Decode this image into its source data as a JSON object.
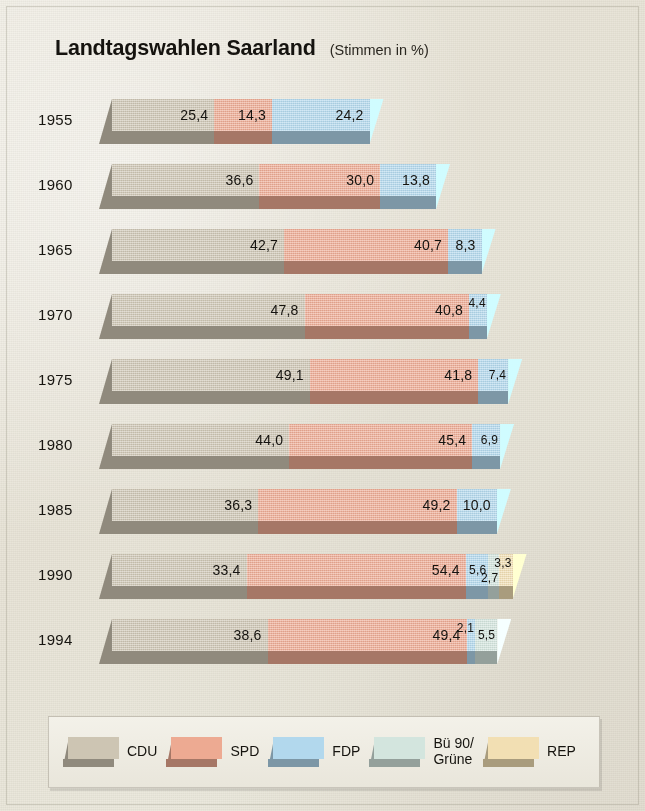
{
  "header": {
    "title": "Landtagswahlen Saarland",
    "subtitle": "(Stimmen in %)"
  },
  "chart_data": {
    "type": "bar",
    "orientation": "horizontal",
    "stacked": true,
    "title": "Landtagswahlen Saarland",
    "subtitle": "(Stimmen in %)",
    "xlabel": "",
    "ylabel": "",
    "unit": "%",
    "decimal_separator": ",",
    "grid": false,
    "legend_position": "bottom",
    "categories": [
      "1955",
      "1960",
      "1965",
      "1970",
      "1975",
      "1980",
      "1985",
      "1990",
      "1994"
    ],
    "series": [
      {
        "name": "CDU",
        "color": "#cdc5b3",
        "values": [
          25.4,
          36.6,
          42.7,
          47.8,
          49.1,
          44.0,
          36.3,
          33.4,
          38.6
        ]
      },
      {
        "name": "SPD",
        "color": "#edaa92",
        "values": [
          14.3,
          30.0,
          40.7,
          40.8,
          41.8,
          45.4,
          49.2,
          54.4,
          49.4
        ]
      },
      {
        "name": "FDP",
        "color": "#b2d8ed",
        "values": [
          24.2,
          13.8,
          8.3,
          4.4,
          7.4,
          6.9,
          10.0,
          5.6,
          2.1
        ]
      },
      {
        "name": "Bü 90/Grüne",
        "color": "#d3e5de",
        "values": [
          null,
          null,
          null,
          null,
          null,
          null,
          null,
          2.7,
          5.5
        ]
      },
      {
        "name": "REP",
        "color": "#f2dfb3",
        "values": [
          null,
          null,
          null,
          null,
          null,
          null,
          null,
          3.3,
          null
        ]
      }
    ],
    "rows": [
      {
        "year": "1955",
        "segments": [
          {
            "party": "CDU",
            "label": "25,4",
            "value": 25.4
          },
          {
            "party": "SPD",
            "label": "14,3",
            "value": 14.3
          },
          {
            "party": "FDP",
            "label": "24,2",
            "value": 24.2
          }
        ]
      },
      {
        "year": "1960",
        "segments": [
          {
            "party": "CDU",
            "label": "36,6",
            "value": 36.6
          },
          {
            "party": "SPD",
            "label": "30,0",
            "value": 30.0
          },
          {
            "party": "FDP",
            "label": "13,8",
            "value": 13.8
          }
        ]
      },
      {
        "year": "1965",
        "segments": [
          {
            "party": "CDU",
            "label": "42,7",
            "value": 42.7
          },
          {
            "party": "SPD",
            "label": "40,7",
            "value": 40.7
          },
          {
            "party": "FDP",
            "label": "8,3",
            "value": 8.3
          }
        ]
      },
      {
        "year": "1970",
        "segments": [
          {
            "party": "CDU",
            "label": "47,8",
            "value": 47.8
          },
          {
            "party": "SPD",
            "label": "40,8",
            "value": 40.8
          },
          {
            "party": "FDP",
            "label": "4,4",
            "value": 4.4
          }
        ]
      },
      {
        "year": "1975",
        "segments": [
          {
            "party": "CDU",
            "label": "49,1",
            "value": 49.1
          },
          {
            "party": "SPD",
            "label": "41,8",
            "value": 41.8
          },
          {
            "party": "FDP",
            "label": "7,4",
            "value": 7.4
          }
        ]
      },
      {
        "year": "1980",
        "segments": [
          {
            "party": "CDU",
            "label": "44,0",
            "value": 44.0
          },
          {
            "party": "SPD",
            "label": "45,4",
            "value": 45.4
          },
          {
            "party": "FDP",
            "label": "6,9",
            "value": 6.9
          }
        ]
      },
      {
        "year": "1985",
        "segments": [
          {
            "party": "CDU",
            "label": "36,3",
            "value": 36.3
          },
          {
            "party": "SPD",
            "label": "49,2",
            "value": 49.2
          },
          {
            "party": "FDP",
            "label": "10,0",
            "value": 10.0
          }
        ]
      },
      {
        "year": "1990",
        "segments": [
          {
            "party": "CDU",
            "label": "33,4",
            "value": 33.4
          },
          {
            "party": "SPD",
            "label": "54,4",
            "value": 54.4
          },
          {
            "party": "FDP",
            "label": "5,6",
            "value": 5.6
          },
          {
            "party": "Bü 90/Grüne",
            "label": "2,7",
            "value": 2.7
          },
          {
            "party": "REP",
            "label": "3,3",
            "value": 3.3
          }
        ]
      },
      {
        "year": "1994",
        "segments": [
          {
            "party": "CDU",
            "label": "38,6",
            "value": 38.6
          },
          {
            "party": "SPD",
            "label": "49,4",
            "value": 49.4
          },
          {
            "party": "FDP",
            "label": "2,1",
            "value": 2.1
          },
          {
            "party": "Bü 90/Grüne",
            "label": "5,5",
            "value": 5.5
          }
        ]
      }
    ]
  },
  "legend": {
    "items": [
      {
        "label": "CDU",
        "label2": "",
        "color": "#cdc5b3"
      },
      {
        "label": "SPD",
        "label2": "",
        "color": "#edaa92"
      },
      {
        "label": "FDP",
        "label2": "",
        "color": "#b2d8ed"
      },
      {
        "label": "Bü 90/",
        "label2": "Grüne",
        "color": "#d3e5de"
      },
      {
        "label": "REP",
        "label2": "",
        "color": "#f2dfb3"
      }
    ]
  },
  "colors": {
    "background": "#e9e6dc",
    "text": "#16140f",
    "cdu": "#cdc5b3",
    "spd": "#edaa92",
    "fdp": "#b2d8ed",
    "gruene": "#d3e5de",
    "rep": "#f2dfb3"
  }
}
